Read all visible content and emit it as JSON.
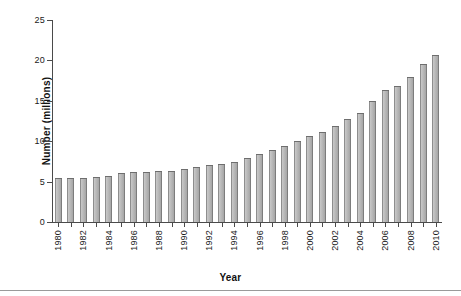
{
  "chart_data": {
    "type": "bar",
    "title": "",
    "xlabel": "Year",
    "ylabel": "Number (millions)",
    "ylim": [
      0,
      25
    ],
    "yticks": [
      0,
      5,
      10,
      15,
      20,
      25
    ],
    "ytick_labels": [
      "0",
      "5",
      "10",
      "15",
      "20",
      "25"
    ],
    "grid": false,
    "legend": "none",
    "xtick_labels": [
      "1980",
      "1982",
      "1984",
      "1986",
      "1988",
      "1990",
      "1992",
      "1994",
      "1996",
      "1998",
      "2000",
      "2002",
      "2004",
      "2006",
      "2008",
      "2010"
    ],
    "xtick_label_interval": 2,
    "bar_color": "#b4b4b4",
    "bar_edge_color": "#6e6e6e",
    "categories": [
      "1980",
      "1981",
      "1982",
      "1983",
      "1984",
      "1985",
      "1986",
      "1987",
      "1988",
      "1989",
      "1990",
      "1991",
      "1992",
      "1993",
      "1994",
      "1995",
      "1996",
      "1997",
      "1998",
      "1999",
      "2000",
      "2001",
      "2002",
      "2003",
      "2004",
      "2005",
      "2006",
      "2007",
      "2008",
      "2009",
      "2010"
    ],
    "values": [
      5.5,
      5.5,
      5.5,
      5.6,
      5.7,
      6.1,
      6.2,
      6.2,
      6.3,
      6.3,
      6.5,
      6.8,
      7.0,
      7.2,
      7.4,
      7.9,
      8.4,
      8.9,
      9.4,
      10.0,
      10.6,
      11.2,
      11.9,
      12.7,
      13.5,
      15.0,
      16.4,
      16.8,
      18.0,
      19.6,
      20.7
    ]
  }
}
